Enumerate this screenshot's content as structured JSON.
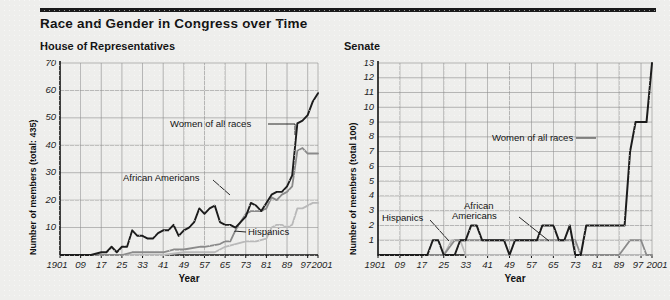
{
  "title": "Race and Gender in Congress over Time",
  "colors": {
    "rule": "#1a1a1a",
    "background": "#eeeeec",
    "grid": "#8d8d8d",
    "axis": "#111111",
    "women": "#1c1c1c",
    "african_americans": "#8a8a8a",
    "hispanics": "#b9b9b9"
  },
  "panels": {
    "house": {
      "title": "House of Representatives"
    },
    "senate": {
      "title": "Senate"
    }
  },
  "annotations": {
    "house": {
      "women": "Women of all races",
      "african_americans": "African Americans",
      "hispanics": "Hispanics"
    },
    "senate": {
      "women": "Women of all races",
      "african_americans_line1": "African",
      "african_americans_line2": "Americans",
      "hispanics": "Hispanics"
    }
  },
  "chart_data": [
    {
      "type": "line",
      "title": "House of Representatives",
      "xlabel": "Year",
      "ylabel": "Number of members (total: 435)",
      "xlim": [
        1901,
        2001
      ],
      "ylim": [
        0,
        70
      ],
      "yticks": [
        10,
        20,
        30,
        40,
        50,
        60,
        70
      ],
      "xticks": [
        1901,
        1909,
        1917,
        1925,
        1933,
        1941,
        1949,
        1957,
        1965,
        1973,
        1981,
        1989,
        1997,
        2001
      ],
      "xticklabels": [
        "1901",
        "09",
        "17",
        "25",
        "33",
        "41",
        "49",
        "57",
        "65",
        "73",
        "81",
        "89",
        "97",
        "2001"
      ],
      "grid": true,
      "legend": "inline-annotations",
      "series": [
        {
          "name": "Women of all races",
          "color": "#1c1c1c",
          "x": [
            1901,
            1905,
            1909,
            1913,
            1917,
            1919,
            1921,
            1923,
            1925,
            1927,
            1929,
            1931,
            1933,
            1935,
            1937,
            1939,
            1941,
            1943,
            1945,
            1947,
            1949,
            1951,
            1953,
            1955,
            1957,
            1959,
            1961,
            1963,
            1965,
            1967,
            1969,
            1971,
            1973,
            1975,
            1977,
            1979,
            1981,
            1983,
            1985,
            1987,
            1989,
            1991,
            1993,
            1995,
            1997,
            1999,
            2001
          ],
          "values": [
            0,
            0,
            0,
            0,
            1,
            1,
            3,
            1,
            3,
            3,
            9,
            7,
            7,
            6,
            6,
            8,
            9,
            9,
            11,
            7,
            9,
            10,
            12,
            17,
            15,
            17,
            18,
            12,
            11,
            11,
            10,
            12,
            14,
            19,
            18,
            16,
            19,
            22,
            23,
            23,
            25,
            29,
            48,
            49,
            51,
            56,
            59
          ]
        },
        {
          "name": "African Americans",
          "color": "#8a8a8a",
          "x": [
            1901,
            1909,
            1917,
            1925,
            1929,
            1933,
            1941,
            1945,
            1949,
            1955,
            1957,
            1963,
            1965,
            1967,
            1969,
            1971,
            1973,
            1975,
            1977,
            1979,
            1981,
            1983,
            1985,
            1987,
            1989,
            1991,
            1993,
            1995,
            1997,
            1999,
            2001
          ],
          "values": [
            0,
            0,
            0,
            0,
            1,
            1,
            1,
            2,
            2,
            3,
            3,
            4,
            5,
            5,
            9,
            12,
            15,
            16,
            16,
            16,
            17,
            21,
            20,
            22,
            23,
            25,
            38,
            39,
            37,
            37,
            37
          ]
        },
        {
          "name": "Hispanics",
          "color": "#b9b9b9",
          "x": [
            1901,
            1909,
            1917,
            1925,
            1933,
            1941,
            1949,
            1957,
            1961,
            1965,
            1969,
            1973,
            1977,
            1981,
            1983,
            1985,
            1987,
            1989,
            1991,
            1993,
            1995,
            1997,
            1999,
            2001
          ],
          "values": [
            0,
            0,
            0,
            0,
            0,
            0,
            1,
            1,
            1,
            3,
            4,
            5,
            5,
            6,
            10,
            11,
            11,
            10,
            11,
            17,
            17,
            18,
            19,
            19
          ]
        }
      ]
    },
    {
      "type": "line",
      "title": "Senate",
      "xlabel": "Year",
      "ylabel": "Number of members (total 100)",
      "xlim": [
        1901,
        2001
      ],
      "ylim": [
        0,
        13
      ],
      "yticks": [
        1,
        2,
        3,
        4,
        5,
        6,
        7,
        8,
        9,
        10,
        11,
        12,
        13
      ],
      "xticks": [
        1901,
        1909,
        1917,
        1925,
        1933,
        1941,
        1949,
        1957,
        1965,
        1973,
        1981,
        1989,
        1997,
        2001
      ],
      "xticklabels": [
        "1901",
        "09",
        "17",
        "25",
        "33",
        "41",
        "49",
        "57",
        "65",
        "73",
        "81",
        "89",
        "97",
        "2001"
      ],
      "grid": true,
      "legend": "inline-annotations",
      "series": [
        {
          "name": "Women of all races",
          "color": "#1c1c1c",
          "x": [
            1901,
            1919,
            1921,
            1923,
            1925,
            1927,
            1929,
            1931,
            1933,
            1935,
            1937,
            1939,
            1941,
            1943,
            1945,
            1947,
            1949,
            1951,
            1953,
            1955,
            1957,
            1959,
            1961,
            1963,
            1965,
            1967,
            1969,
            1971,
            1973,
            1975,
            1977,
            1979,
            1981,
            1989,
            1991,
            1993,
            1995,
            1997,
            1999,
            2001
          ],
          "values": [
            0,
            0,
            1,
            1,
            0,
            0,
            0,
            1,
            1,
            2,
            2,
            1,
            1,
            1,
            1,
            1,
            0,
            1,
            1,
            1,
            1,
            1,
            2,
            2,
            2,
            1,
            1,
            2,
            0,
            0,
            2,
            2,
            2,
            2,
            2,
            7,
            9,
            9,
            9,
            13
          ]
        },
        {
          "name": "African Americans",
          "color": "#8a8a8a",
          "x": [
            1901,
            1925,
            1929,
            1933,
            1941,
            1949,
            1957,
            1965,
            1967,
            1969,
            1971,
            1973,
            1975,
            1977,
            1979,
            1981,
            1989,
            1993,
            1995,
            1997,
            1999,
            2001
          ],
          "values": [
            0,
            0,
            1,
            1,
            1,
            1,
            1,
            1,
            1,
            1,
            1,
            1,
            0,
            0,
            0,
            0,
            0,
            1,
            1,
            1,
            0,
            0
          ]
        },
        {
          "name": "Hispanics",
          "color": "#b9b9b9",
          "x": [
            1901,
            1925,
            1928,
            1931,
            1933,
            1941,
            1949,
            1957,
            1965,
            1973,
            1981,
            1989,
            1993,
            1997,
            2001
          ],
          "values": [
            0,
            0,
            1,
            1,
            0,
            0,
            0,
            0,
            0,
            0,
            0,
            0,
            0,
            0,
            0
          ]
        }
      ]
    }
  ]
}
